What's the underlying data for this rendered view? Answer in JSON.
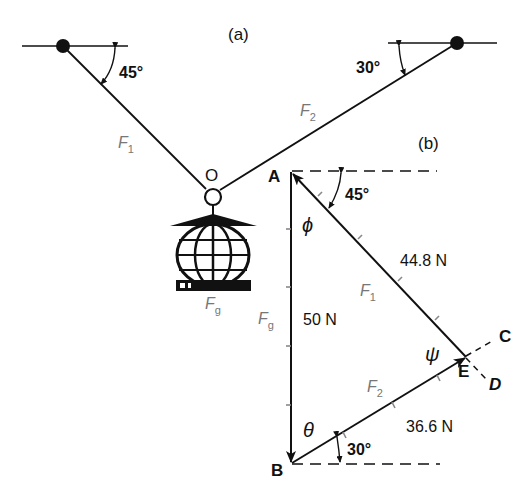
{
  "figure": {
    "panel_a_label": "(a)",
    "panel_b_label": "(b)",
    "colors": {
      "ink": "#111111",
      "force_label": "#777777",
      "tick": "#888888",
      "background": "#ffffff"
    }
  },
  "panel_a": {
    "left_angle": "45°",
    "right_angle": "30°",
    "force_left": {
      "symbol": "F",
      "subscript": "1"
    },
    "force_right": {
      "symbol": "F",
      "subscript": "2"
    },
    "junction_label": "O",
    "weight": {
      "symbol": "F",
      "subscript": "g"
    }
  },
  "panel_b": {
    "points": {
      "A": "A",
      "B": "B",
      "C": "C",
      "D": "D",
      "E": "E"
    },
    "vertical_force": {
      "symbol": "F",
      "subscript": "g",
      "magnitude": "50 N"
    },
    "force_1": {
      "symbol": "F",
      "subscript": "1",
      "magnitude": "44.8 N"
    },
    "force_2": {
      "symbol": "F",
      "subscript": "2",
      "magnitude": "36.6 N"
    },
    "angle_top": "45°",
    "angle_bottom": "30°",
    "greek": {
      "phi": "ϕ",
      "theta": "θ",
      "psi": "ψ"
    }
  }
}
